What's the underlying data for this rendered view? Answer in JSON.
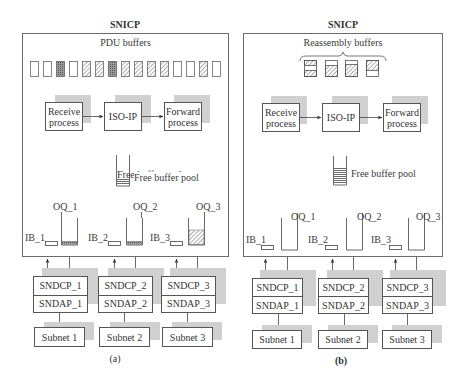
{
  "diagram": {
    "panels": [
      {
        "id": "a",
        "title": "SNICP",
        "buffer_label": "PDU buffers",
        "buffers": [
          "empty",
          "empty",
          "dotted",
          "empty",
          "hatch",
          "hatch",
          "dotted",
          "hatch",
          "hatch",
          "hatch",
          "hatch",
          "empty",
          "empty",
          "hatch",
          "empty",
          "hatch"
        ],
        "processes": [
          "Receive process",
          "ISO-IP",
          "Forward process"
        ],
        "process_lines": [
          [
            "Receive",
            "process"
          ],
          [
            "ISO-IP"
          ],
          [
            "Forward",
            "process"
          ]
        ],
        "free_pool_label": "Free buffer pool",
        "input_buffers": [
          "IB_1",
          "IB_2",
          "IB_3"
        ],
        "output_queues": [
          "OQ_1",
          "OQ_2",
          "OQ_3"
        ],
        "output_queue_fill": [
          "low",
          "low",
          "high"
        ],
        "sndcp": [
          "SNDCP_1",
          "SNDCP_2",
          "SNDCP_3"
        ],
        "sndap": [
          "SNDAP_1",
          "SNDAP_2",
          "SNDAP_3"
        ],
        "subnets": [
          "Subnet 1",
          "Subnet 2",
          "Subnet 3"
        ],
        "caption": "(a)"
      },
      {
        "id": "b",
        "title": "SNICP",
        "buffer_label": "Reassembly buffers",
        "buffers": [
          "top-bottom-hatch",
          "bottom-hatch",
          "bottom-hatch-large",
          "top-hatch"
        ],
        "processes": [
          "Receive process",
          "ISO-IP",
          "Forward process"
        ],
        "process_lines": [
          [
            "Receive",
            "process"
          ],
          [
            "ISO-IP"
          ],
          [
            "Forward",
            "process"
          ]
        ],
        "free_pool_label": "Free buffer pool",
        "input_buffers": [
          "IB_1",
          "IB_2",
          "IB_3"
        ],
        "output_queues": [
          "OQ_1",
          "OQ_2",
          "OQ_3"
        ],
        "output_queue_fill": [
          "none",
          "none",
          "none"
        ],
        "sndcp": [
          "SNDCP_1",
          "SNDCP_2",
          "SNDCP_3"
        ],
        "sndap": [
          "SNDAP_1",
          "SNDAP_2",
          "SNDAP_3"
        ],
        "subnets": [
          "Subnet 1",
          "Subnet 2",
          "Subnet 3"
        ],
        "caption": "(b)"
      }
    ]
  }
}
